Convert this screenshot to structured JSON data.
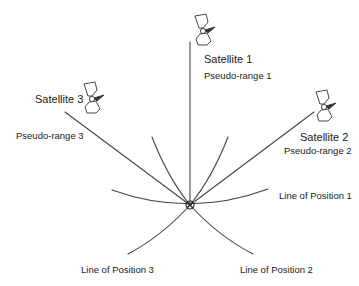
{
  "diagram": {
    "type": "gps-trilateration",
    "stroke_color": "#444444",
    "satellites": [
      {
        "label": "Satellite 1",
        "range_label": "Pseudo-range 1"
      },
      {
        "label": "Satellite 2",
        "range_label": "Pseudo-range 2"
      },
      {
        "label": "Satellite 3",
        "range_label": "Pseudo-range 3"
      }
    ],
    "lines_of_position": [
      {
        "label": "Line of Position 1"
      },
      {
        "label": "Line of Position 2"
      },
      {
        "label": "Line of Position 3"
      }
    ],
    "icons": {
      "satellite": "satellite-icon",
      "fix_marker": "position-fix-marker-icon"
    }
  }
}
